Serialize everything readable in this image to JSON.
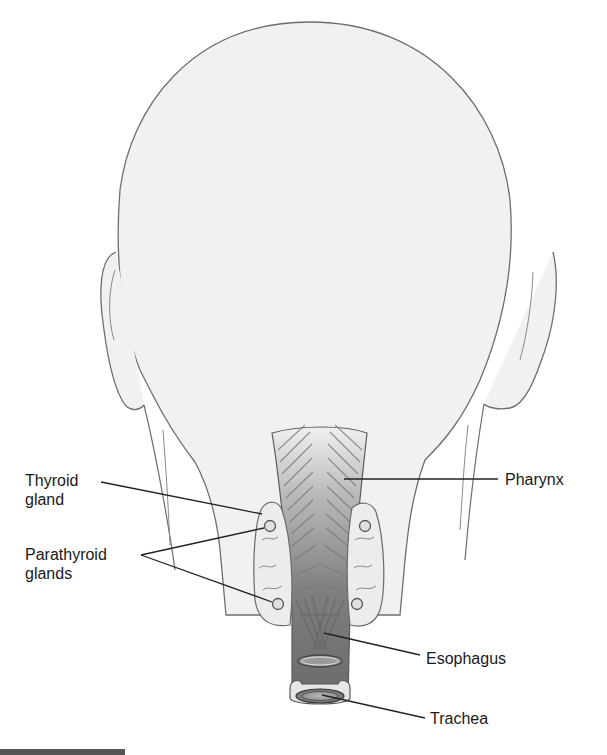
{
  "figure": {
    "labels": {
      "thyroid_gland": "Thyroid\ngland",
      "parathyroid_glands": "Parathyroid\nglands",
      "pharynx": "Pharynx",
      "esophagus": "Esophagus",
      "trachea": "Trachea"
    },
    "colors": {
      "background": "#ffffff",
      "skin_fill": "#f1f1f1",
      "outline": "#6e6e6e",
      "leader_line": "#222222",
      "gland_fill": "#ececec",
      "pharynx_top": "#e4e4e4",
      "esophagus_dark": "#6f6f6f"
    }
  }
}
